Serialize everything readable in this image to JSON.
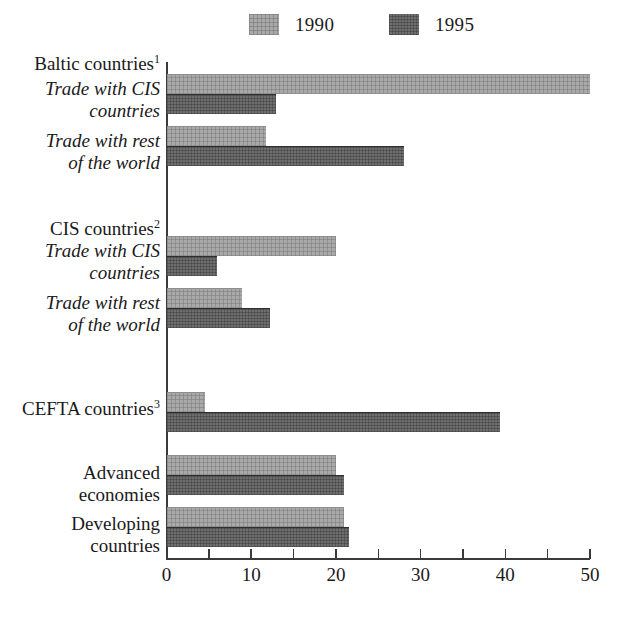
{
  "chart_data": {
    "type": "bar",
    "orientation": "horizontal",
    "title": "",
    "xlabel": "",
    "ylabel": "",
    "xlim": [
      0,
      50
    ],
    "xticks": [
      0,
      5,
      10,
      15,
      20,
      25,
      30,
      35,
      40,
      45,
      50
    ],
    "xticklabels": [
      "0",
      "",
      "10",
      "",
      "20",
      "",
      "30",
      "",
      "40",
      "",
      "50"
    ],
    "grid": false,
    "legend_position": "top",
    "legend": [
      "1990",
      "1995"
    ],
    "series": [
      {
        "name": "1990",
        "color": "#a9a9a9",
        "values": [
          50.0,
          11.8,
          20.0,
          8.9,
          4.6,
          20.0,
          21.0
        ]
      },
      {
        "name": "1995",
        "color": "#6e6e6e",
        "values": [
          12.9,
          28.0,
          6.0,
          12.2,
          39.4,
          21.0,
          21.5
        ]
      }
    ],
    "categories": [
      "Trade with CIS countries",
      "Trade with rest of the world",
      "Trade with CIS countries",
      "Trade with rest of the world",
      "CEFTA countries",
      "Advanced economies",
      "Developing countries"
    ],
    "groups": [
      {
        "heading": "Baltic countries",
        "footnote": "1"
      },
      {
        "heading": "CIS countries",
        "footnote": "2"
      }
    ]
  },
  "legend": {
    "entries": [
      {
        "label": "1990",
        "swatch": "swatch-1990",
        "color": "#a9a9a9"
      },
      {
        "label": "1995",
        "swatch": "swatch-1995",
        "color": "#6e6e6e"
      }
    ]
  },
  "axis": {
    "ticklabels": [
      "0",
      "10",
      "20",
      "30",
      "40",
      "50"
    ]
  },
  "labels": {
    "baltic_heading": "Baltic countries",
    "baltic_heading_sup": "1",
    "cis_heading": "CIS countries",
    "cis_heading_sup": "2",
    "trade_cis_l1": "Trade with CIS",
    "trade_cis_l2": "countries",
    "trade_row_l1": "Trade with rest",
    "trade_row_l2": "of the world",
    "cefta": "CEFTA countries",
    "cefta_sup": "3",
    "advanced_l1": "Advanced",
    "advanced_l2": "economies",
    "developing_l1": "Developing",
    "developing_l2": "countries"
  }
}
